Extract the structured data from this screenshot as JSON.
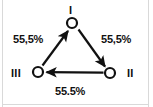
{
  "figure": {
    "type": "directed-cycle-diagram",
    "width": 153,
    "height": 107,
    "background_color": "#ffffff",
    "stroke_color": "#111111",
    "frame_color": "#d9d9d9"
  },
  "nodes": [
    {
      "id": "I",
      "label": "I",
      "label_position": "above",
      "x": 72,
      "y": 23
    },
    {
      "id": "II",
      "label": "II",
      "label_position": "right",
      "x": 110,
      "y": 73
    },
    {
      "id": "III",
      "label": "III",
      "label_position": "left",
      "x": 38,
      "y": 72
    }
  ],
  "edges": [
    {
      "from": "I",
      "to": "II",
      "label": "55,5%",
      "label_position": "upper-right"
    },
    {
      "from": "II",
      "to": "III",
      "label": "55.5%",
      "label_position": "bottom"
    },
    {
      "from": "III",
      "to": "I",
      "label": "55,5%",
      "label_position": "upper-left"
    }
  ],
  "labels": {
    "node_1": "I",
    "node_2": "II",
    "node_3": "III",
    "edge_3_to_1": "55,5%",
    "edge_1_to_2": "55,5%",
    "edge_2_to_3": "55.5%"
  }
}
